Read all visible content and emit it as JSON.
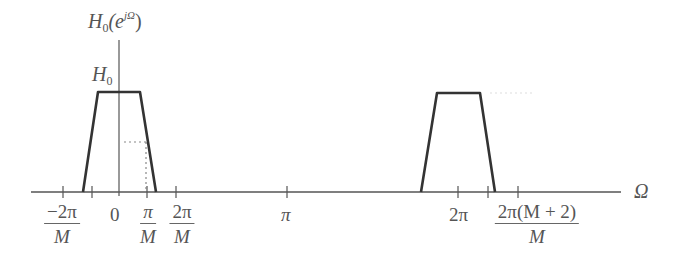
{
  "diagram": {
    "y_axis_label": {
      "base": "H",
      "sub": "0",
      "open": "(e",
      "sup": "jΩ",
      "close": ")"
    },
    "level_label": {
      "base": "H",
      "sub": "0"
    },
    "x_axis_label": "Ω",
    "tick_labels": {
      "neg_two_pi_over_M": {
        "num": "−2π",
        "den": "M"
      },
      "zero": "0",
      "pi_over_M": {
        "num": "π",
        "den": "M"
      },
      "two_pi_over_M": {
        "num": "2π",
        "den": "M"
      },
      "pi": "π",
      "two_pi": "2π",
      "two_pi_M_plus_2_over_M": {
        "num": "2π(M + 2)",
        "den": "M"
      }
    },
    "colors": {
      "curve": "#333333",
      "axis": "#555555",
      "dotted": "#888888",
      "text": "#555555"
    }
  }
}
